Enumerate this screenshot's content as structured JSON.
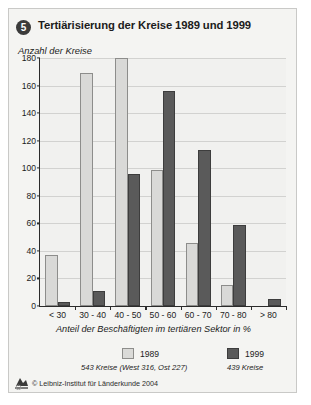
{
  "figure": {
    "number_badge": "5",
    "title": "Tertiärisierung der Kreise 1989 und 1999",
    "subtitle": "Anzahl der Kreise",
    "xaxis_title": "Anteil der Beschäftigten im tertiären Sektor in %",
    "copyright": "© Leibniz-Institut für Länderkunde 2004",
    "logo_icon": "llk-logo-icon",
    "colors": {
      "series_1989": "#d9d9d7",
      "series_1999": "#5a5a5a",
      "background": "#f4f4f2",
      "axis": "#2b2b2b",
      "grid": "#d2d2d0",
      "badge": "#3b3b3b"
    }
  },
  "legend": {
    "entries": [
      {
        "label": "1989",
        "note": "543 Kreise (West 316, Ost 227)",
        "color": "#d9d9d7"
      },
      {
        "label": "1999",
        "note": "439 Kreise",
        "color": "#5a5a5a"
      }
    ]
  },
  "chart_data": {
    "type": "bar",
    "title": "Tertiärisierung der Kreise 1989 und 1999",
    "subtitle": "Anzahl der Kreise",
    "xlabel": "Anteil der Beschäftigten im tertiären Sektor in %",
    "ylabel": "Anzahl der Kreise",
    "categories": [
      "< 30",
      "30 - 40",
      "40 - 50",
      "50 - 60",
      "60 - 70",
      "70 - 80",
      "> 80"
    ],
    "series": [
      {
        "name": "1989",
        "values": [
          37,
          169,
          180,
          99,
          46,
          15,
          0
        ]
      },
      {
        "name": "1999",
        "values": [
          3,
          11,
          96,
          156,
          113,
          59,
          5
        ]
      }
    ],
    "ylim": [
      0,
      180
    ],
    "yticks": [
      0,
      20,
      40,
      60,
      80,
      100,
      120,
      140,
      160,
      180
    ],
    "ytick_labels": [
      "0",
      "20",
      "40",
      "60",
      "80",
      "100",
      "120",
      "140",
      "160",
      "180"
    ],
    "grid": true,
    "legend_position": "bottom"
  }
}
